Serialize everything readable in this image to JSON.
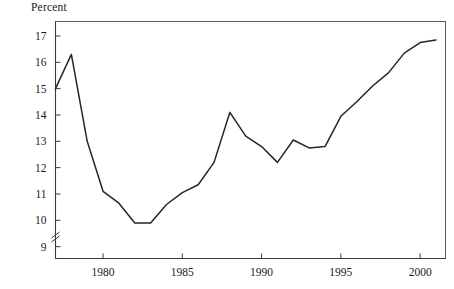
{
  "axis_label": {
    "y": "Percent"
  },
  "colors": {
    "line": "#262626",
    "frame": "#5a5a5a",
    "axis": "#3a3a3a",
    "text": "#1a1a1a",
    "background": "#ffffff"
  },
  "chart_data": {
    "type": "line",
    "title": "",
    "xlabel": "",
    "ylabel": "Percent",
    "xlim": [
      1977,
      2001.6
    ],
    "ylim": [
      8.55,
      17.55
    ],
    "grid": false,
    "legend": null,
    "y_axis_break": true,
    "y_axis_break_symbol": "≠",
    "yticks": [
      9,
      10,
      11,
      12,
      13,
      14,
      15,
      16,
      17
    ],
    "ytick_labels": [
      "9",
      "10",
      "11",
      "12",
      "13",
      "14",
      "15",
      "16",
      "17"
    ],
    "xticks": [
      1980,
      1985,
      1990,
      1995,
      2000
    ],
    "xtick_labels": [
      "1980",
      "1985",
      "1990",
      "1995",
      "2000"
    ],
    "series": [
      {
        "name": "Percent",
        "x": [
          1977,
          1978,
          1979,
          1980,
          1981,
          1982,
          1983,
          1984,
          1985,
          1986,
          1987,
          1988,
          1989,
          1990,
          1991,
          1992,
          1993,
          1994,
          1995,
          1996,
          1997,
          1998,
          1999,
          2000,
          2001
        ],
        "values": [
          15.0,
          16.3,
          13.0,
          11.1,
          10.65,
          9.9,
          9.9,
          10.6,
          11.05,
          11.35,
          12.2,
          14.1,
          13.2,
          12.8,
          12.2,
          13.05,
          12.75,
          12.8,
          13.95,
          14.5,
          15.1,
          15.6,
          16.35,
          16.75,
          16.85
        ]
      }
    ]
  }
}
